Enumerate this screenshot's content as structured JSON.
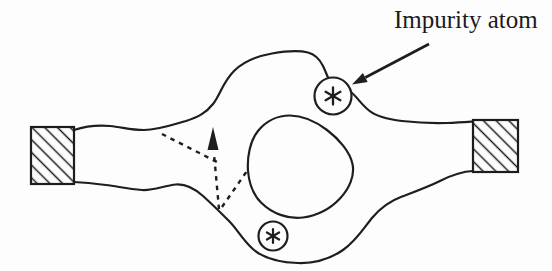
{
  "diagram": {
    "label_impurity": "Impurity atom",
    "impurity_marker_glyph": "*",
    "colors": {
      "ink": "#1c1c1c",
      "paper": "#fdfdfd"
    }
  }
}
